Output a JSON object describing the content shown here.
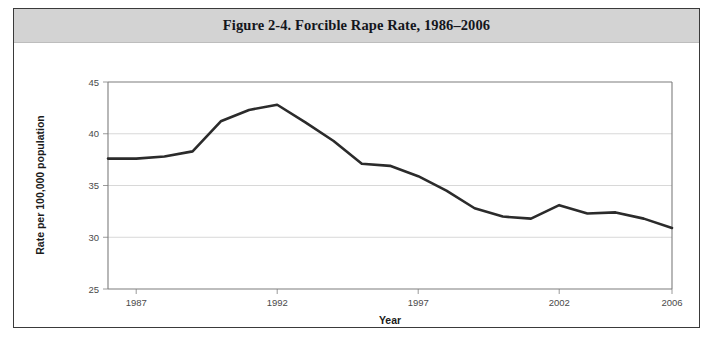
{
  "figure": {
    "title": "Figure 2-4. Forcible Rape Rate, 1986–2006"
  },
  "chart_data": {
    "type": "line",
    "title": "Figure 2-4. Forcible Rape Rate, 1986–2006",
    "xlabel": "Year",
    "ylabel": "Rate per 100,000 population",
    "x": [
      1986,
      1987,
      1988,
      1989,
      1990,
      1991,
      1992,
      1993,
      1994,
      1995,
      1996,
      1997,
      1998,
      1999,
      2000,
      2001,
      2002,
      2003,
      2004,
      2005,
      2006
    ],
    "values": [
      37.6,
      37.6,
      37.8,
      38.3,
      41.2,
      42.3,
      42.8,
      41.1,
      39.3,
      37.1,
      36.9,
      35.9,
      34.5,
      32.8,
      32.0,
      31.8,
      33.1,
      32.3,
      32.4,
      31.8,
      30.9
    ],
    "series": [
      {
        "name": "Forcible rape rate",
        "values": [
          37.6,
          37.6,
          37.8,
          38.3,
          41.2,
          42.3,
          42.8,
          41.1,
          39.3,
          37.1,
          36.9,
          35.9,
          34.5,
          32.8,
          32.0,
          31.8,
          33.1,
          32.3,
          32.4,
          31.8,
          30.9
        ]
      }
    ],
    "xlim": [
      1986,
      2006
    ],
    "ylim": [
      25,
      45
    ],
    "x_ticks": [
      1987,
      1992,
      1997,
      2002,
      2006
    ],
    "x_tick_labels": [
      "1987",
      "1992",
      "1997",
      "2002",
      "2006"
    ],
    "y_ticks": [
      25,
      30,
      35,
      40,
      45
    ],
    "y_tick_labels": [
      "25",
      "30",
      "35",
      "40",
      "45"
    ],
    "grid": true,
    "grid_axis": "y",
    "legend": false,
    "line_color": "#2b2b2b",
    "background_color": "#ffffff",
    "title_band_color": "#d3d3d3"
  }
}
